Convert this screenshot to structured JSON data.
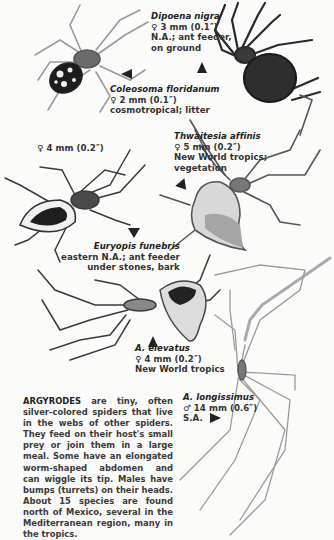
{
  "species": [
    {
      "id": "dipoena-nigra",
      "name": "Dipoena nigra",
      "sex_symbol": "♀",
      "size": "3 mm (0.1″)",
      "range": "N.A.; ant feeder,",
      "habitat": "on ground"
    },
    {
      "id": "coleosoma-floridanum",
      "name": "Coleosoma floridanum",
      "sex_symbol": "♀",
      "size": "2 mm (0.1″)",
      "range": "cosmotropical; litter"
    },
    {
      "id": "thwaitesia-affinis",
      "name": "Thwaitesia affinis",
      "sex_symbol": "♀",
      "size": "5 mm (0.2″)",
      "range": "New World tropics;",
      "habitat": "vegetation"
    },
    {
      "id": "euryopis-funebris",
      "name": "Euryopis funebris",
      "sex_symbol": "♀",
      "size": "4 mm (0.2″)",
      "range": "eastern N.A.; ant feeder",
      "habitat": "under stones, bark"
    },
    {
      "id": "a-elevatus",
      "name": "A. elevatus",
      "sex_symbol": "♀",
      "size": "4 mm (0.2″)",
      "range": "New World tropics"
    },
    {
      "id": "a-longissimus",
      "name": "A. longissimus",
      "sex_symbol": "♂",
      "size": "14 mm (0.6″)",
      "range": "S.A."
    }
  ],
  "description": {
    "lead": "ARGYRODES",
    "text": " are tiny, often silver-colored spiders that live in the webs of other spiders. They feed on their host's small prey or join them in a large meal. Some have an elongated worm-shaped abdomen and can wiggle its tip. Males have bumps (turrets) on their heads. About 15 species are found north of Mexico, several in the Mediterranean region, many in the tropics."
  },
  "colors": {
    "background": "#fbfbf9",
    "ink": "#222222",
    "leg_gray": "#8a8a8a"
  }
}
